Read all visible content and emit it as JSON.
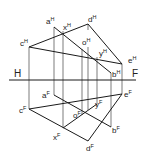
{
  "axis": {
    "left_label": "H",
    "right_label": "F"
  },
  "views": {
    "top": {
      "superscript": "H",
      "points": {
        "a": {
          "label": "a",
          "sup": "H"
        },
        "b": {
          "label": "b",
          "sup": "H"
        },
        "c": {
          "label": "c",
          "sup": "H"
        },
        "d": {
          "label": "d",
          "sup": "H"
        },
        "e": {
          "label": "e",
          "sup": "H"
        },
        "o": {
          "label": "o",
          "sup": "H"
        },
        "x": {
          "label": "x",
          "sup": "H"
        },
        "y": {
          "label": "y",
          "sup": "H"
        }
      }
    },
    "front": {
      "superscript": "F",
      "points": {
        "a": {
          "label": "a",
          "sup": "F"
        },
        "b": {
          "label": "b",
          "sup": "F"
        },
        "c": {
          "label": "c",
          "sup": "F"
        },
        "d": {
          "label": "d",
          "sup": "F"
        },
        "e": {
          "label": "e",
          "sup": "F"
        },
        "o": {
          "label": "o",
          "sup": "F"
        },
        "x": {
          "label": "x",
          "sup": "F"
        },
        "y": {
          "label": "y",
          "sup": "F"
        }
      }
    }
  },
  "colors": {
    "line": "#1a1a1a",
    "projector": "#444444",
    "background": "#ffffff"
  }
}
